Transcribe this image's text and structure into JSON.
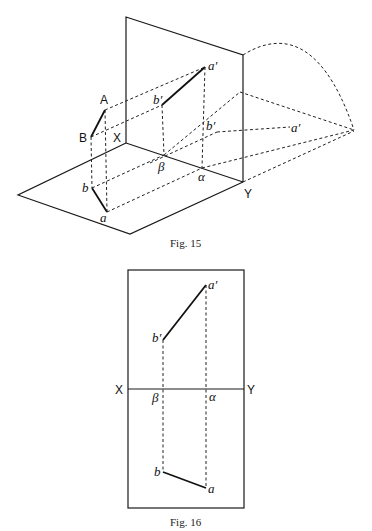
{
  "figures": [
    {
      "caption": "Fig. 15",
      "labels": {
        "A": "A",
        "B": "B",
        "X": "X",
        "Y": "Y",
        "a": "a",
        "b": "b",
        "a_prime": "a′",
        "b_prime": "b′",
        "beta": "β",
        "alpha": "α",
        "b_prime_rotated": "b′",
        "a_prime_rotated": "a′"
      }
    },
    {
      "caption": "Fig. 16",
      "labels": {
        "X": "X",
        "Y": "Y",
        "a": "a",
        "b": "b",
        "a_prime": "a′",
        "b_prime": "b′",
        "beta": "β",
        "alpha": "α"
      }
    }
  ],
  "colors": {
    "line": "#1a1a1a",
    "background": "#ffffff"
  }
}
